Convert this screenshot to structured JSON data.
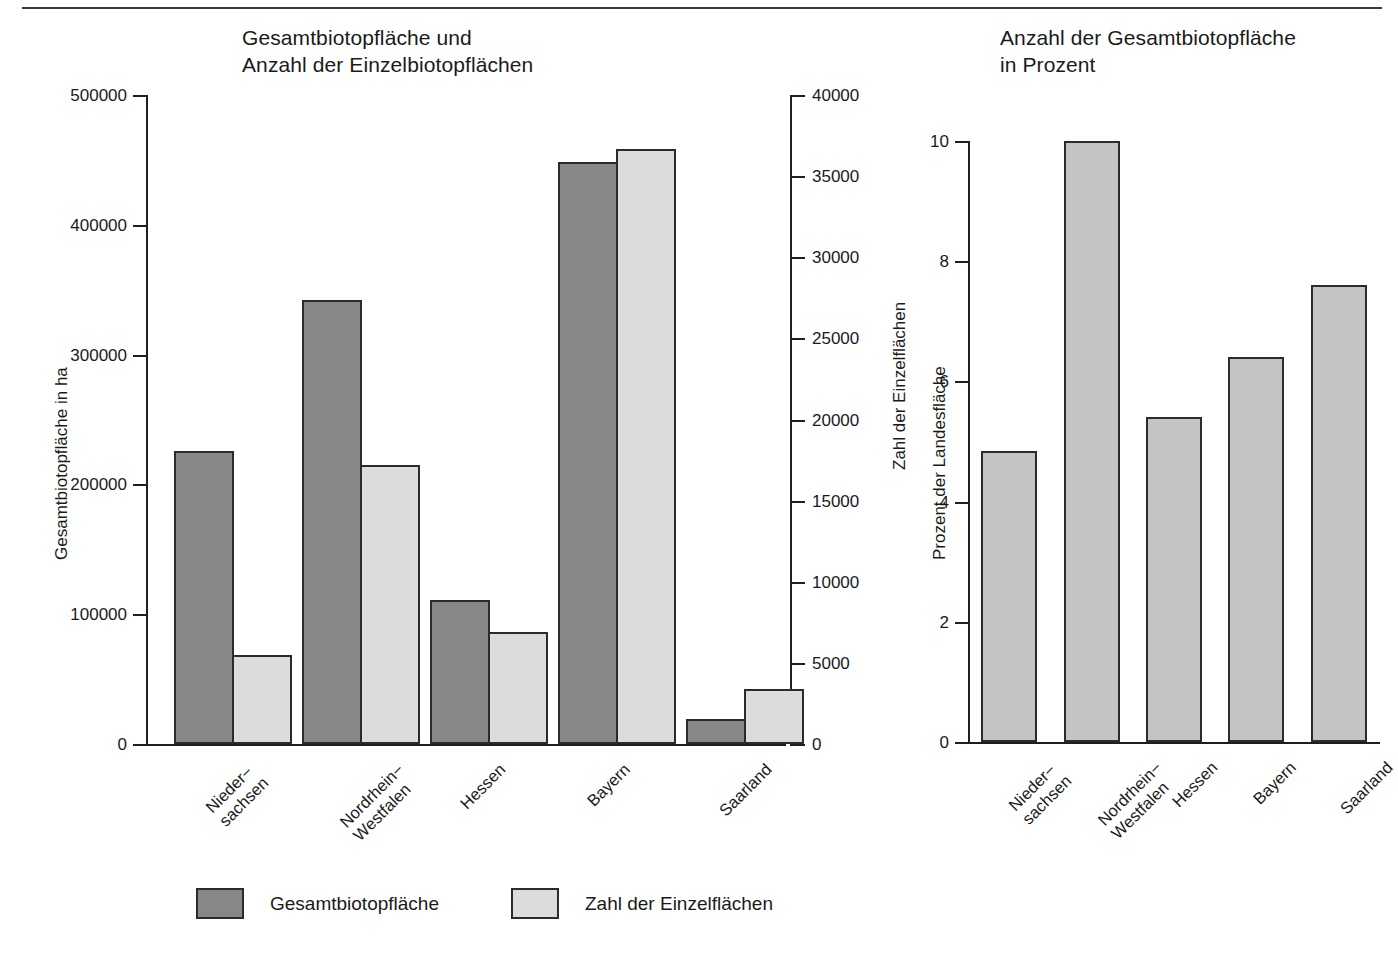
{
  "page": {
    "background": "#ffffff",
    "rule_color": "#3a3a3a"
  },
  "colors": {
    "dark_gray": "#878787",
    "light_gray": "#dcdcdc",
    "mid_gray": "#c4c4c4",
    "outline": "#2b2b2b",
    "text": "#1a1a1a"
  },
  "legend": {
    "items": [
      {
        "label": "Gesamtbiotopfläche",
        "color": "#878787"
      },
      {
        "label": "Zahl der Einzelflächen",
        "color": "#dcdcdc"
      }
    ]
  },
  "chart_data": [
    {
      "id": "chart-left",
      "type": "bar",
      "title": "Gesamtbiotopfläche und\nAnzahl der Einzelbiotopflächen",
      "xlabel": "",
      "ylabel": "Gesamtbiotopfläche in ha",
      "y2label": "Zahl der Einzelflächen",
      "categories": [
        "Nieder−\nsachsen",
        "Nordrhein−\nWestfalen",
        "Hessen",
        "Bayern",
        "Saarland"
      ],
      "ylim": [
        0,
        500000
      ],
      "yticks": [
        0,
        100000,
        200000,
        300000,
        400000,
        500000
      ],
      "yticklabels": [
        "0",
        "100000",
        "200000",
        "300000",
        "400000",
        "500000"
      ],
      "y2lim": [
        0,
        40000
      ],
      "y2ticks": [
        0,
        5000,
        10000,
        15000,
        20000,
        25000,
        30000,
        35000,
        40000
      ],
      "y2ticklabels": [
        "0",
        "5000",
        "10000",
        "15000",
        "20000",
        "25000",
        "30000",
        "35000",
        "40000"
      ],
      "grid": false,
      "legend_position": "bottom",
      "series": [
        {
          "name": "Gesamtbiotopfläche",
          "axis": "left",
          "color": "#878787",
          "values": [
            226000,
            342000,
            111000,
            448000,
            19000
          ]
        },
        {
          "name": "Zahl der Einzelflächen",
          "axis": "right",
          "color": "#dcdcdc",
          "values": [
            5500,
            17200,
            6900,
            36700,
            3400
          ]
        }
      ]
    },
    {
      "id": "chart-right",
      "type": "bar",
      "title": "Anzahl der Gesamtbiotopfläche\nin Prozent",
      "xlabel": "",
      "ylabel": "Prozent der Landesfläche",
      "categories": [
        "Nieder−\nsachsen",
        "Nordrhein−\nWestfalen",
        "Hessen",
        "Bayern",
        "Saarland"
      ],
      "ylim": [
        0,
        10
      ],
      "yticks": [
        0,
        2,
        4,
        6,
        8,
        10
      ],
      "yticklabels": [
        "0",
        "2",
        "4",
        "6",
        "8",
        "10"
      ],
      "grid": false,
      "legend_position": "none",
      "series": [
        {
          "name": "Prozent der Landesfläche",
          "axis": "left",
          "color": "#c4c4c4",
          "values": [
            4.85,
            10.0,
            5.4,
            6.4,
            7.6
          ]
        }
      ]
    }
  ]
}
